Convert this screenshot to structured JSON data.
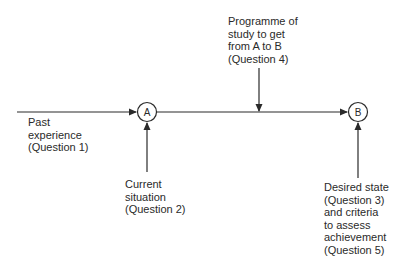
{
  "diagram": {
    "colors": {
      "stroke": "#2a2a2a",
      "text": "#2a2a2a",
      "background": "#ffffff"
    },
    "nodes": [
      {
        "id": "A",
        "label": "A"
      },
      {
        "id": "B",
        "label": "B"
      }
    ],
    "labels": {
      "past_experience": {
        "lines": [
          "Past",
          "experience",
          "(Question 1)"
        ]
      },
      "current_situation": {
        "lines": [
          "Current",
          "situation",
          "(Question 2)"
        ]
      },
      "programme_of_study": {
        "lines": [
          "Programme of",
          "study to get",
          "from A to B",
          "(Question 4)"
        ]
      },
      "desired_state": {
        "lines": [
          "Desired state",
          "(Question 3)",
          "and criteria",
          "to assess",
          "achievement",
          "(Question 5)"
        ]
      }
    },
    "edges": [
      {
        "from": "past-experience",
        "to": "A",
        "direction": "right"
      },
      {
        "from": "A",
        "to": "B",
        "direction": "right"
      },
      {
        "from": "programme-of-study",
        "to": "A-B line",
        "direction": "down"
      },
      {
        "from": "current-situation",
        "to": "A",
        "direction": "up"
      },
      {
        "from": "desired-state",
        "to": "B",
        "direction": "up"
      }
    ]
  }
}
